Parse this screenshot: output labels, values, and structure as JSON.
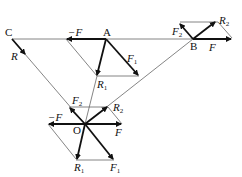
{
  "diagram": {
    "title": "",
    "points": [
      {
        "id": "C",
        "label": "C",
        "x": 12,
        "y": 39
      },
      {
        "id": "A",
        "label": "A",
        "x": 106,
        "y": 39
      },
      {
        "id": "B",
        "label": "B",
        "x": 193,
        "y": 39
      },
      {
        "id": "O",
        "label": "O",
        "x": 85,
        "y": 124
      }
    ],
    "vector_labels": {
      "C_R": "R",
      "A_negF": "−F",
      "A_F1": "F",
      "A_F1_sub": "1",
      "A_R1": "R",
      "A_R1_sub": "1",
      "B_F2": "F",
      "B_F2_sub": "2",
      "B_R2": "R",
      "B_R2_sub": "2",
      "B_F": "F",
      "O_F2": "F",
      "O_F2_sub": "2",
      "O_R2": "R",
      "O_R2_sub": "2",
      "O_negF": "−F",
      "O_F": "F",
      "O_R1": "R",
      "O_R1_sub": "1",
      "O_F1": "F",
      "O_F1_sub": "1"
    },
    "colors": {
      "vector": "#111111",
      "construction_line": "#666666"
    }
  }
}
